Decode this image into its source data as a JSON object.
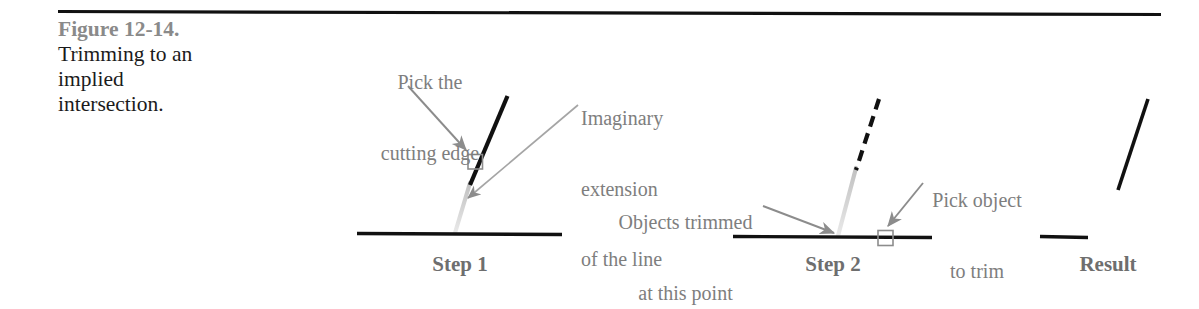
{
  "figure": {
    "caption": {
      "figure_number": "Figure 12-14.",
      "title_line_1": "Trimming to an",
      "title_line_2": "implied",
      "title_line_3": "intersection."
    },
    "colors": {
      "rule": "#111111",
      "object_line": "#111111",
      "phantom_line": "#c9c9c9",
      "annotation_text": "#7e7e7e",
      "figure_number_text": "#8a8a8a",
      "caption_text": "#1b1b1b",
      "arrow": "#8c8c8c",
      "pick_box_stroke": "#8c8c8c",
      "background": "#ffffff"
    },
    "annotations": [
      {
        "name": "pick-the-cutting-edge",
        "line_1": "Pick the",
        "line_2": "cutting edge"
      },
      {
        "name": "imaginary-extension-of-the-line",
        "line_1": "Imaginary",
        "line_2": "extension",
        "line_3": "of the line"
      },
      {
        "name": "objects-trimmed-at-this-point",
        "line_1": "Objects trimmed",
        "line_2": "at this point"
      },
      {
        "name": "pick-object-to-trim",
        "line_1": "Pick object",
        "line_2": "to trim"
      }
    ],
    "steps": [
      {
        "name": "step-1",
        "label": "Step 1"
      },
      {
        "name": "step-2",
        "label": "Step 2"
      },
      {
        "name": "result",
        "label": "Result"
      }
    ]
  }
}
